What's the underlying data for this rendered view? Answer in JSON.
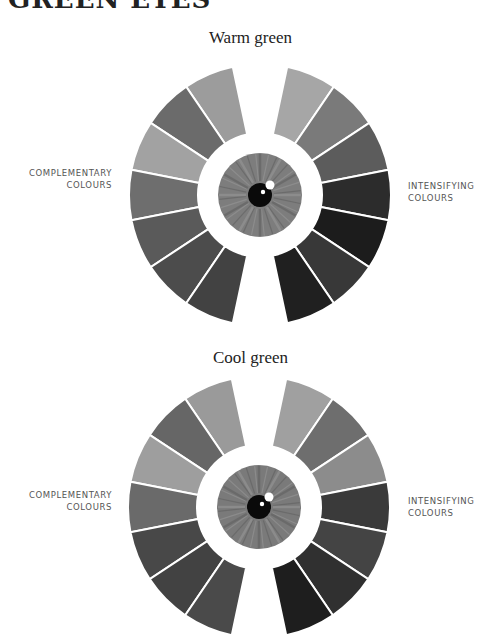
{
  "page": {
    "title": "GREEN EYES"
  },
  "wheels": [
    {
      "id": "warm",
      "title": "Warm green",
      "left_label": [
        "COMPLEMENTARY",
        "COLOURS"
      ],
      "right_label": [
        "INTENSIFYING",
        "COLOURS"
      ],
      "center": [
        260,
        195
      ],
      "left_segments": [
        "#9c9c9c",
        "#6b6b6b",
        "#a2a2a2",
        "#6e6e6e",
        "#5a5a5a",
        "#4c4c4c",
        "#424242"
      ],
      "right_segments": [
        "#a6a6a6",
        "#7a7a7a",
        "#5c5c5c",
        "#2c2c2c",
        "#1c1c1c",
        "#383838",
        "#202020"
      ],
      "iris_color": "#7d7d7d",
      "eye": "eye-warm-green"
    },
    {
      "id": "cool",
      "title": "Cool green",
      "left_label": [
        "COMPLEMENTARY",
        "COLOURS"
      ],
      "right_label": [
        "INTENSIFYING",
        "COLOURS"
      ],
      "center": [
        259,
        507
      ],
      "left_segments": [
        "#9a9a9a",
        "#666666",
        "#9e9e9e",
        "#6a6a6a",
        "#484848",
        "#424242",
        "#4a4a4a"
      ],
      "right_segments": [
        "#a0a0a0",
        "#6e6e6e",
        "#8c8c8c",
        "#3a3a3a",
        "#444444",
        "#303030",
        "#1e1e1e"
      ],
      "iris_color": "#7a7a7a",
      "eye": "eye-cool-green"
    }
  ]
}
